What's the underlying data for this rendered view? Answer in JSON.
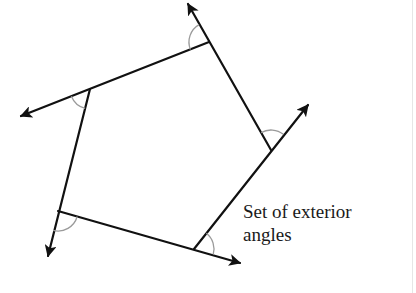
{
  "diagram": {
    "label": {
      "line1": "Set of exterior",
      "line2": "angles"
    },
    "colors": {
      "stroke": "#111111",
      "arc": "#9a9a9a",
      "text": "#1a1a1a"
    },
    "vertices": [
      {
        "name": "top",
        "x": 209,
        "y": 42,
        "ray_to": [
          188,
          3
        ]
      },
      {
        "name": "left",
        "x": 90,
        "y": 89,
        "ray_to": [
          20,
          116
        ]
      },
      {
        "name": "bottom-left",
        "x": 58,
        "y": 211,
        "ray_to": [
          47,
          257
        ]
      },
      {
        "name": "bottom",
        "x": 194,
        "y": 249,
        "ray_to": [
          241,
          263
        ]
      },
      {
        "name": "right",
        "x": 271,
        "y": 150,
        "ray_to": [
          309,
          104
        ]
      }
    ],
    "exterior_angle_count": 5
  }
}
